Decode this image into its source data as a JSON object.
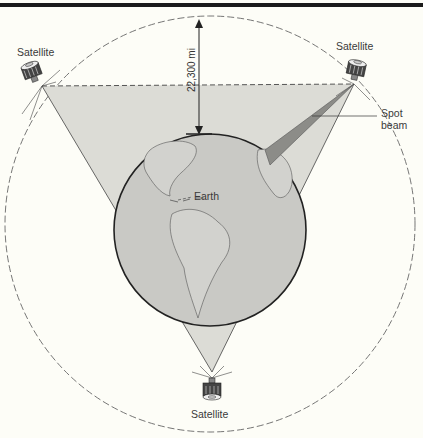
{
  "diagram": {
    "labels": {
      "satellite_left": "Satellite",
      "satellite_right": "Satellite",
      "satellite_bottom": "Satellite",
      "earth": "Earth",
      "spot_beam": "Spot\nbeam",
      "spot_beam_line1": "Spot",
      "spot_beam_line2": "beam",
      "distance": "22,300 mi"
    },
    "colors": {
      "background": "#fdfdf7",
      "coverage_fill": "#dcdcd6",
      "earth_fill": "#c9c9c5",
      "spot_beam_fill": "#8c8c88",
      "outline": "#2a2a2a",
      "orbit_dash": "#666666"
    },
    "geometry": {
      "earth": {
        "cx": 210,
        "cy": 230,
        "r": 96
      },
      "orbit": {
        "cx": 210,
        "cy": 224,
        "r": 205
      },
      "satellites": [
        {
          "name": "left",
          "x": 42,
          "y": 86
        },
        {
          "name": "right",
          "x": 354,
          "y": 84
        },
        {
          "name": "bottom",
          "x": 212,
          "y": 372
        }
      ]
    }
  }
}
